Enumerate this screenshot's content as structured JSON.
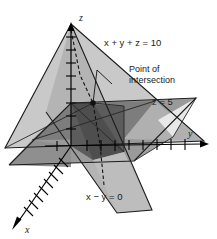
{
  "figure": {
    "axes": {
      "x_label": "x",
      "y_label": "y",
      "z_label": "z"
    },
    "annotations": {
      "plane_sum": "x + y + z = 10",
      "plane_z": "z = 5",
      "plane_diff": "x − y = 0",
      "point_line1": "Point of",
      "point_line2": "intersection"
    },
    "colors": {
      "background": "#ffffff",
      "plane_light": "#cccccc",
      "plane_mid": "#a8a8a8",
      "plane_dark": "#8a8a8a",
      "overlap_dark": "#6b6b6b",
      "overlap_darkest": "#4a4a4a",
      "stroke": "#1a1a1a",
      "text": "#1a1a1a"
    },
    "geometry": {
      "origin": [
        71,
        146
      ],
      "intersection_point": [
        93,
        103
      ],
      "z_axis_tip": [
        71,
        24
      ],
      "y_axis_tip": [
        207,
        143
      ],
      "x_axis_tip": [
        13,
        227
      ],
      "z_ticks": 9,
      "y_ticks": 9,
      "x_ticks": 9
    }
  }
}
